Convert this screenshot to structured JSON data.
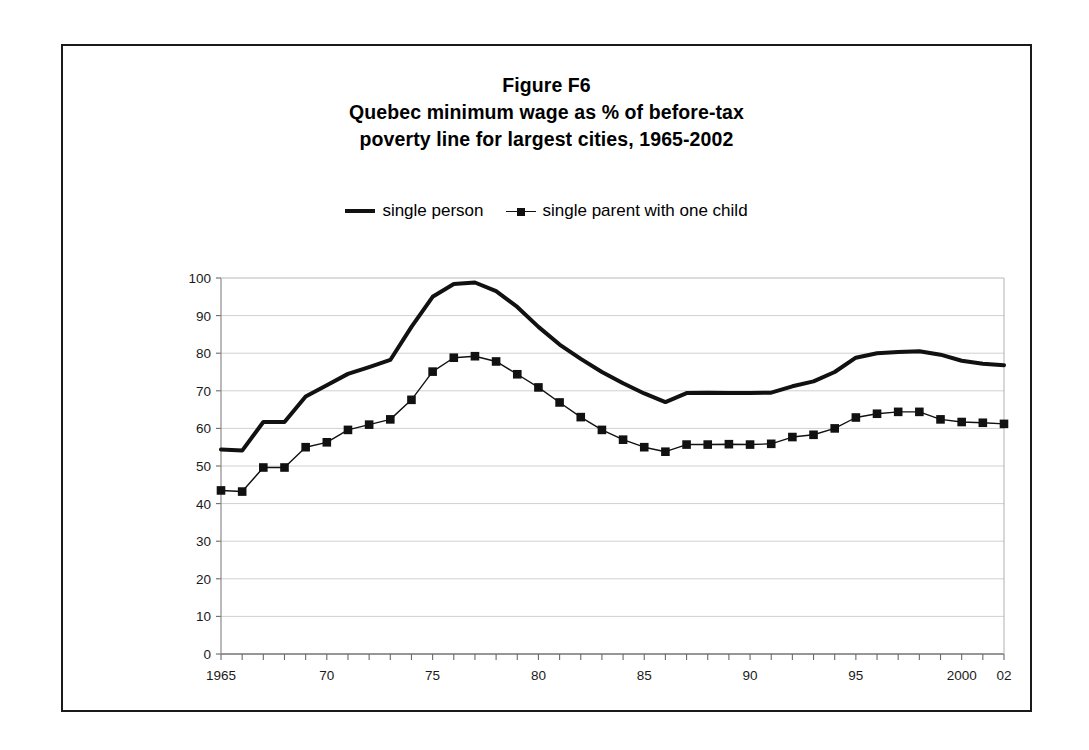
{
  "figure": {
    "title_lines": [
      "Figure F6",
      "Quebec minimum wage as % of before-tax",
      "poverty line for largest cities, 1965-2002"
    ],
    "title_line_1": "Figure F6",
    "title_line_2": "Quebec minimum wage as % of before-tax",
    "title_line_3": "poverty line for largest cities, 1965-2002",
    "border_color": "#1a1a1a",
    "background_color": "#ffffff"
  },
  "legend": {
    "position": "top-center",
    "entries": [
      {
        "label": "single person",
        "marker": "thick-line",
        "color": "#111111"
      },
      {
        "label": "single parent with one child",
        "marker": "line-with-square",
        "color": "#111111"
      }
    ],
    "entry_0_label": "single person",
    "entry_1_label": "single parent with one child"
  },
  "axes": {
    "y_ticks": [
      "0",
      "10",
      "20",
      "30",
      "40",
      "50",
      "60",
      "70",
      "80",
      "90",
      "100"
    ],
    "x_ticks_labeled": [
      "1965",
      "70",
      "75",
      "80",
      "85",
      "90",
      "95",
      "2000",
      "02"
    ],
    "y_label": "",
    "x_label": ""
  },
  "chart_data": {
    "type": "line",
    "xlabel": "",
    "ylabel": "",
    "ylim": [
      0,
      100
    ],
    "xlim": [
      1965,
      2002
    ],
    "y_ticks": [
      0,
      10,
      20,
      30,
      40,
      50,
      60,
      70,
      80,
      90,
      100
    ],
    "x_tick_labels": {
      "1965": "1965",
      "1970": "70",
      "1975": "75",
      "1980": "80",
      "1985": "85",
      "1990": "90",
      "1995": "95",
      "2000": "2000",
      "2002": "02"
    },
    "grid": "horizontal",
    "legend_position": "above-plot-center",
    "x": [
      1965,
      1966,
      1967,
      1968,
      1969,
      1970,
      1971,
      1972,
      1973,
      1974,
      1975,
      1976,
      1977,
      1978,
      1979,
      1980,
      1981,
      1982,
      1983,
      1984,
      1985,
      1986,
      1987,
      1988,
      1989,
      1990,
      1991,
      1992,
      1993,
      1994,
      1995,
      1996,
      1997,
      1998,
      1999,
      2000,
      2001,
      2002
    ],
    "series": [
      {
        "name": "single person",
        "marker": "none",
        "line_width": 4,
        "color": "#111111",
        "values": [
          54.4,
          54.1,
          61.7,
          61.7,
          68.5,
          71.5,
          74.5,
          76.3,
          78.2,
          87.0,
          95.0,
          98.4,
          98.8,
          96.5,
          92.3,
          87.0,
          82.3,
          78.5,
          75.0,
          72.0,
          69.3,
          67.0,
          69.4,
          69.5,
          69.4,
          69.4,
          69.5,
          71.2,
          72.5,
          75.0,
          78.8,
          80.0,
          80.3,
          80.5,
          79.6,
          78.0,
          77.2,
          76.8
        ]
      },
      {
        "name": "single parent with one child",
        "marker": "square",
        "line_width": 1.4,
        "color": "#111111",
        "values": [
          43.5,
          43.2,
          49.6,
          49.6,
          55.0,
          56.3,
          59.6,
          61.0,
          62.4,
          67.6,
          75.1,
          78.8,
          79.2,
          77.8,
          74.4,
          70.9,
          66.9,
          63.0,
          59.6,
          57.0,
          55.0,
          53.8,
          55.7,
          55.7,
          55.8,
          55.7,
          55.9,
          57.7,
          58.3,
          60.0,
          62.9,
          63.9,
          64.4,
          64.4,
          62.4,
          61.7,
          61.5,
          61.2
        ]
      }
    ]
  }
}
